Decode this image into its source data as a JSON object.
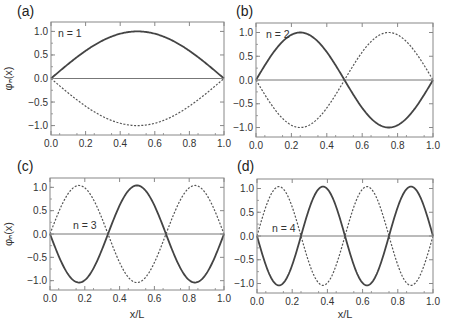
{
  "figure": {
    "xlabel": "x/L",
    "ylabel": "φₙ(x)",
    "colors": {
      "solid": "#444444",
      "dashed": "#555555",
      "axis": "#888888",
      "zero_line": "#777777"
    }
  },
  "chart_data": [
    {
      "type": "line",
      "panel": "(a)",
      "annotation": "n = 1",
      "n": 1,
      "xlim": [
        0.0,
        1.0
      ],
      "ylim": [
        -1.2,
        1.2
      ],
      "xticks": [
        "0.0",
        "0.2",
        "0.4",
        "0.6",
        "0.8",
        "1.0"
      ],
      "yticks": [
        "1.0",
        "0.5",
        "0.0",
        "-0.5",
        "-1.0"
      ],
      "xlabel": "",
      "ylabel": "φₙ(x)",
      "series": [
        {
          "name": "solid",
          "style": "solid",
          "function": "sin(πx)",
          "x": [
            0,
            0.1,
            0.2,
            0.3,
            0.4,
            0.5,
            0.6,
            0.7,
            0.8,
            0.9,
            1.0
          ],
          "y": [
            0,
            0.31,
            0.59,
            0.81,
            0.95,
            1.0,
            0.95,
            0.81,
            0.59,
            0.31,
            0
          ]
        },
        {
          "name": "dashed",
          "style": "dashed",
          "function": "-sin(πx)",
          "x": [
            0,
            0.1,
            0.2,
            0.3,
            0.4,
            0.5,
            0.6,
            0.7,
            0.8,
            0.9,
            1.0
          ],
          "y": [
            0,
            -0.31,
            -0.59,
            -0.81,
            -0.95,
            -1.0,
            -0.95,
            -0.81,
            -0.59,
            -0.31,
            0
          ]
        }
      ]
    },
    {
      "type": "line",
      "panel": "(b)",
      "annotation": "n = 2",
      "n": 2,
      "xlim": [
        0.0,
        1.0
      ],
      "ylim": [
        -1.2,
        1.2
      ],
      "xticks": [
        "0.0",
        "0.2",
        "0.4",
        "0.6",
        "0.8",
        "1.0"
      ],
      "yticks": [
        "1.0",
        "0.5",
        "0.0",
        "-0.5",
        "-1.0"
      ],
      "xlabel": "",
      "ylabel": "",
      "series": [
        {
          "name": "solid",
          "style": "solid",
          "function": "sin(2πx)",
          "x": [
            0,
            0.25,
            0.5,
            0.75,
            1.0
          ],
          "y": [
            0,
            1.0,
            0,
            -1.0,
            0
          ]
        },
        {
          "name": "dashed",
          "style": "dashed",
          "function": "-sin(2πx)",
          "x": [
            0,
            0.25,
            0.5,
            0.75,
            1.0
          ],
          "y": [
            0,
            -1.0,
            0,
            1.0,
            0
          ]
        }
      ]
    },
    {
      "type": "line",
      "panel": "(c)",
      "annotation": "n = 3",
      "n": 3,
      "xlim": [
        0.0,
        1.0
      ],
      "ylim": [
        -1.2,
        1.2
      ],
      "xticks": [
        "0.0",
        "0.2",
        "0.4",
        "0.6",
        "0.8",
        "1.0"
      ],
      "yticks": [
        "1.0",
        "0.5",
        "0.0",
        "-0.5",
        "-1.0"
      ],
      "xlabel": "x/L",
      "ylabel": "φₙ(x)",
      "series": [
        {
          "name": "solid",
          "style": "solid",
          "function": "-sin(3πx)",
          "x": [
            0,
            0.2,
            0.35,
            0.5,
            0.65,
            0.8,
            1.0
          ],
          "y": [
            0,
            -1.08,
            0,
            1.0,
            0,
            -1.08,
            0
          ]
        },
        {
          "name": "dashed",
          "style": "dashed",
          "function": "sin(3πx)",
          "x": [
            0,
            0.2,
            0.35,
            0.5,
            0.65,
            0.8,
            1.0
          ],
          "y": [
            0,
            1.08,
            0,
            -1.0,
            0,
            1.08,
            0
          ]
        }
      ]
    },
    {
      "type": "line",
      "panel": "(d)",
      "annotation": "n = 4",
      "n": 4,
      "xlim": [
        0.0,
        1.0
      ],
      "ylim": [
        -1.2,
        1.2
      ],
      "xticks": [
        "0.0",
        "0.2",
        "0.4",
        "0.6",
        "0.8",
        "1.0"
      ],
      "yticks": [
        "1.0",
        "0.5",
        "0.0",
        "-0.5",
        "-1.0"
      ],
      "xlabel": "x/L",
      "ylabel": "",
      "series": [
        {
          "name": "solid",
          "style": "solid",
          "function": "-sin(4πx)",
          "x": [
            0,
            0.16,
            0.28,
            0.39,
            0.5,
            0.61,
            0.72,
            0.84,
            1.0
          ],
          "y": [
            0,
            -1.08,
            0,
            1.0,
            0,
            -1.0,
            0,
            1.05,
            0
          ]
        },
        {
          "name": "dashed",
          "style": "dashed",
          "function": "sin(4πx)",
          "x": [
            0,
            0.16,
            0.28,
            0.39,
            0.5,
            0.61,
            0.72,
            0.84,
            1.0
          ],
          "y": [
            0,
            1.08,
            0,
            -1.0,
            0,
            1.0,
            0,
            -1.08,
            0
          ]
        }
      ]
    }
  ],
  "layout": {
    "panels": [
      {
        "left": 51,
        "top": 22,
        "right": 224,
        "bottom": 135,
        "label_x": 17,
        "label_y": 16,
        "ann_x": 58,
        "ann_y": 37,
        "show_ylabel": true,
        "show_xlabel": false
      },
      {
        "left": 256,
        "top": 23,
        "right": 433,
        "bottom": 137,
        "label_x": 236,
        "label_y": 16,
        "ann_x": 266,
        "ann_y": 38,
        "show_ylabel": false,
        "show_xlabel": false
      },
      {
        "left": 50,
        "top": 178,
        "right": 224,
        "bottom": 290,
        "label_x": 17,
        "label_y": 171,
        "ann_x": 73,
        "ann_y": 229,
        "show_ylabel": true,
        "show_xlabel": true
      },
      {
        "left": 257,
        "top": 179,
        "right": 433,
        "bottom": 293,
        "label_x": 237,
        "label_y": 171,
        "ann_x": 272,
        "ann_y": 232,
        "show_ylabel": false,
        "show_xlabel": true
      }
    ]
  }
}
